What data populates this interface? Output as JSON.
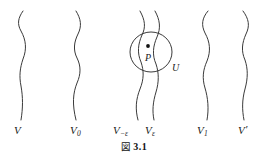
{
  "figure": {
    "caption_prefix": "図",
    "caption_number": "3.1",
    "background_color": "#ffffff",
    "stroke_color": "#3a3a3a",
    "text_color": "#1a1a1a"
  },
  "curves": [
    {
      "name": "V",
      "label_base": "V",
      "label_sub": "",
      "label_prime": "",
      "label_x": 14,
      "label_y": 124
    },
    {
      "name": "V0",
      "label_base": "V",
      "label_sub": "0",
      "label_prime": "",
      "label_x": 70,
      "label_y": 124
    },
    {
      "name": "V-eps",
      "label_base": "V",
      "label_sub": "−ε",
      "label_prime": "",
      "label_x": 113,
      "label_y": 124
    },
    {
      "name": "Veps",
      "label_base": "V",
      "label_sub": "ε",
      "label_prime": "",
      "label_x": 145,
      "label_y": 124
    },
    {
      "name": "V1",
      "label_base": "V",
      "label_sub": "1",
      "label_prime": "",
      "label_x": 197,
      "label_y": 124
    },
    {
      "name": "Vprime",
      "label_base": "V",
      "label_sub": "",
      "label_prime": "′",
      "label_x": 238,
      "label_y": 124
    }
  ],
  "neighborhood": {
    "circle_label": "U",
    "circle_label_x": 172,
    "circle_label_y": 63,
    "point_label": "P",
    "point_label_x": 145,
    "point_label_y": 53,
    "point_x": 148,
    "point_y": 46,
    "circle_center_x": 151,
    "circle_center_y": 52,
    "circle_radius_x": 21,
    "circle_radius_y": 20
  }
}
